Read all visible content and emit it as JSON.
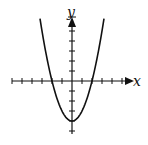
{
  "chart_data": {
    "type": "line",
    "title": "",
    "xlabel": "x",
    "ylabel": "y",
    "function": "y = x^2 - 4",
    "xlim": [
      -6,
      5
    ],
    "ylim": [
      -5,
      6
    ],
    "x_ticks": [
      -6,
      -5,
      -4,
      -3,
      -2,
      -1,
      1,
      2,
      3,
      4,
      5
    ],
    "y_ticks": [
      -5,
      -4,
      -3,
      -2,
      -1,
      1,
      2,
      3,
      4,
      5
    ],
    "tick_labels_shown": false,
    "grid": false,
    "legend": null,
    "series": [
      {
        "name": "parabola",
        "x": [
          -3.2,
          -3,
          -2,
          -1,
          0,
          1,
          2,
          3,
          3.2
        ],
        "y": [
          6.24,
          5,
          0,
          -3,
          -4,
          -3,
          0,
          5,
          6.24
        ]
      }
    ],
    "annotations": {
      "vertex": [
        0,
        -4
      ],
      "x_intercepts": [
        -2,
        2
      ],
      "y_intercept": -4
    }
  },
  "labels": {
    "x_axis": "x",
    "y_axis": "y"
  },
  "colors": {
    "ink": "#111111",
    "background": "#ffffff"
  }
}
